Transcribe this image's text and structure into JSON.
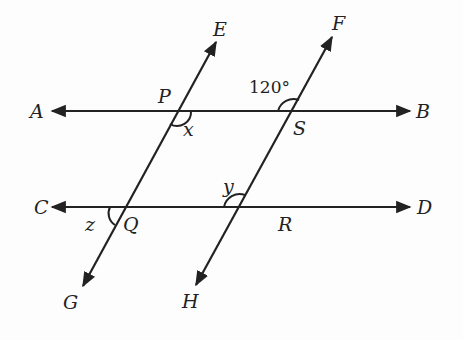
{
  "diagram": {
    "type": "parallel-lines-transversals",
    "lines": [
      {
        "name": "AB",
        "from": "A",
        "to": "B",
        "orientation": "horizontal"
      },
      {
        "name": "CD",
        "from": "C",
        "to": "D",
        "orientation": "horizontal"
      },
      {
        "name": "EG",
        "from": "E",
        "to": "G",
        "orientation": "transversal"
      },
      {
        "name": "FH",
        "from": "F",
        "to": "H",
        "orientation": "transversal"
      }
    ],
    "points": {
      "A": "A",
      "B": "B",
      "C": "C",
      "D": "D",
      "E": "E",
      "F": "F",
      "G": "G",
      "H": "H",
      "P": "P",
      "Q": "Q",
      "R": "R",
      "S": "S"
    },
    "angles": {
      "given": "120°",
      "x": "x",
      "y": "y",
      "z": "z"
    }
  }
}
